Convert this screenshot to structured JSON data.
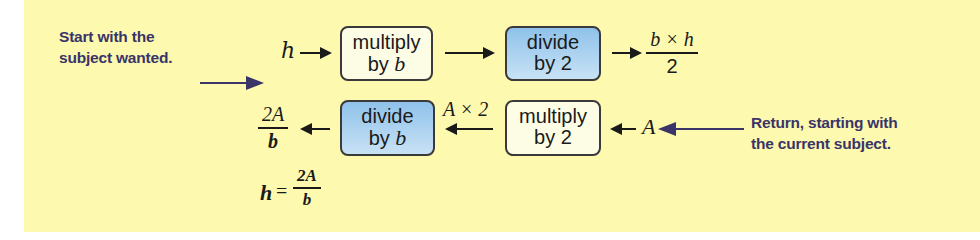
{
  "notes": {
    "start": [
      "Start with the",
      "subject wanted."
    ],
    "return": [
      "Return, starting with",
      "the current subject."
    ]
  },
  "forward_row": {
    "input": "h",
    "box1": {
      "line1": "multiply",
      "line2_prefix": "by ",
      "line2_var": "b"
    },
    "box2": {
      "line1": "divide",
      "line2": "by 2"
    },
    "result": {
      "numerator": "b × h",
      "denominator": "2"
    }
  },
  "reverse_row": {
    "input": "A",
    "box1": {
      "line1": "multiply",
      "line2": "by 2"
    },
    "intermediate": "A × 2",
    "box2": {
      "line1": "divide",
      "line2_prefix": "by ",
      "line2_var": "b"
    },
    "result": {
      "numerator": "2A",
      "denominator": "b"
    }
  },
  "final": {
    "lhs": "h",
    "equals": "=",
    "numerator": "2A",
    "denominator": "b"
  },
  "colors": {
    "background": "#fdfab0",
    "note_text": "#3a3468",
    "blue_box": "#8fc2ea",
    "light_box": "#fdfde6"
  }
}
